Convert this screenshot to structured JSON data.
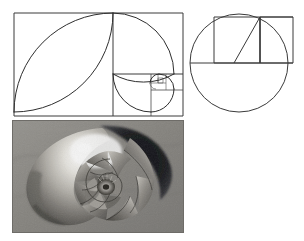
{
  "figure": {
    "title": "Golden Ratio and the Fibonacci Spiral",
    "background_color": "#ffffff",
    "line_color": "#3a3a3a",
    "width": 304,
    "height": 241
  },
  "panels": [
    {
      "id": "golden-rectangle",
      "name": "Golden Rectangle with Fibonacci Spiral",
      "caption": "",
      "bounds": {
        "x": 14,
        "y": 13,
        "width": 169,
        "height": 103
      },
      "ratio_label": "1.618",
      "squares": [
        {
          "index": 1,
          "x": 14,
          "y": 13,
          "size": 99,
          "quadrant": "left"
        },
        {
          "index": 2,
          "x": 113,
          "y": 13,
          "size": 61,
          "quadrant": "top-right"
        },
        {
          "index": 3,
          "x": 113,
          "y": 74,
          "size": 38,
          "quadrant": "bottom-left"
        },
        {
          "index": 4,
          "x": 151,
          "y": 90,
          "size": 23,
          "quadrant": "bottom-right"
        },
        {
          "index": 5,
          "x": 151,
          "y": 74,
          "size": 15,
          "quadrant": "top-right"
        },
        {
          "index": 6,
          "x": 142,
          "y": 74,
          "size": 9,
          "quadrant": "top-left"
        },
        {
          "index": 7,
          "x": 142,
          "y": 83,
          "size": 6,
          "quadrant": "bottom-left"
        }
      ],
      "fibonacci_sequence": [
        1,
        1,
        2,
        3,
        5,
        8,
        13,
        21
      ],
      "spiral_turns": 7
    },
    {
      "id": "circle-construction",
      "name": "Circle with Inscribed Square and Golden Rectangle",
      "caption": "",
      "circle": {
        "cx": 239,
        "cy": 63,
        "r": 49
      },
      "square": {
        "x": 214,
        "y": 17,
        "size": 46
      },
      "extension_rect": {
        "x": 260,
        "y": 17,
        "width": 33,
        "height": 46
      },
      "diagonal": {
        "x1": 214,
        "y1": 63,
        "x2": 260,
        "y2": 17
      },
      "diameter_line": {
        "x1": 190,
        "y1": 63,
        "x2": 293,
        "y2": 63
      }
    },
    {
      "id": "nautilus-photo",
      "name": "Nautilus Shell Cross Section",
      "caption": "",
      "bounds": {
        "x": 13,
        "y": 122,
        "width": 170,
        "height": 110
      },
      "description": "grayscale photograph of a chambered nautilus shell sectioned to reveal its logarithmic spiral chambers",
      "chamber_count": 14,
      "tone": "grayscale"
    }
  ],
  "colors": {
    "line": "#3a3a3a",
    "photo_background": "#8e8d89",
    "shell_highlight": "#f2f0ea",
    "shell_shadow": "#15161a",
    "shell_midtone": "#6f6d68"
  }
}
